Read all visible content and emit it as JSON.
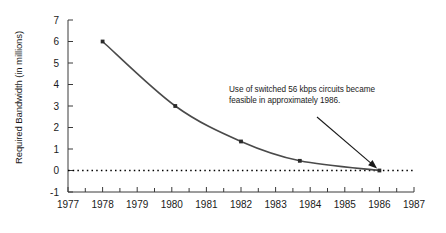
{
  "chart_data": {
    "type": "line",
    "title": "",
    "subtitle": "",
    "xlabel": "",
    "ylabel": "Required Bandwidth (in millions)",
    "xlim": [
      1977,
      1987
    ],
    "ylim": [
      -1,
      7
    ],
    "grid": false,
    "legend": false,
    "legend_position": "none",
    "x_ticks": [
      "1977",
      "1978",
      "1979",
      "1980",
      "1981",
      "1982",
      "1983",
      "1984",
      "1985",
      "1986",
      "1987"
    ],
    "x_tick_values": [
      1977,
      1978,
      1979,
      1980,
      1981,
      1982,
      1983,
      1984,
      1985,
      1986,
      1987
    ],
    "x_minor_ticks": true,
    "y_ticks": [
      "-1",
      "0",
      "1",
      "2",
      "3",
      "4",
      "5",
      "6",
      "7"
    ],
    "y_tick_values": [
      -1,
      0,
      1,
      2,
      3,
      4,
      5,
      6,
      7
    ],
    "zero_reference_line": {
      "value": 0,
      "style": "dotted",
      "color": "#000000",
      "label": ""
    },
    "series": [
      {
        "name": "Required Bandwidth",
        "color": "#4a4a4a",
        "marker": "square",
        "x": [
          1978,
          1980.1,
          1982,
          1983.7,
          1986
        ],
        "values": [
          6.0,
          3.0,
          1.35,
          0.45,
          0.0
        ]
      }
    ],
    "annotations": [
      {
        "text_lines": [
          "Use of switched 56 kbps circuits became",
          "feasible in approximately 1986."
        ],
        "points_to_x": 1986,
        "points_to_y": 0,
        "arrow": true
      }
    ]
  }
}
